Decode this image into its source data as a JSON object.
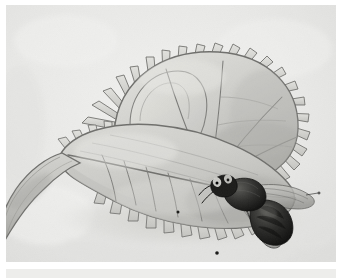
{
  "image": {
    "title": "Venus Flytrap With Captured Fly",
    "medium": "Pencil and wash botanical illustration",
    "palette": "grayscale",
    "subject_label": "Venus flytrap trap lobe",
    "secondary_subject_label": "House fly on trap margin"
  },
  "canvas": {
    "width": 342,
    "height": 278,
    "page_background": "#ffffff",
    "frame_left": 6,
    "frame_top": 5,
    "frame_width": 330,
    "frame_height": 257
  },
  "colors": {
    "paper_background": "#e9e9e7",
    "paper_background_light": "#efefed",
    "paper_background_dark": "#dededc",
    "leaf_fill_light": "#dcdcd8",
    "leaf_fill_mid": "#c9c9c5",
    "leaf_fill_dark": "#b3b3af",
    "leaf_outline": "#6f6f6c",
    "vein_line": "#7b7b78",
    "tooth_fill": "#d6d6d2",
    "tooth_outline": "#6b6b68",
    "stem_fill": "#c4c4c0",
    "stem_shadow": "#9d9d99",
    "fly_body": "#2e2e2c",
    "fly_body_dark": "#141413",
    "fly_wing": "#bdbdb9",
    "fly_leg": "#1c1c1a",
    "ground_shadow": "#d2d2ce",
    "caption_band": "#ededeb"
  },
  "parts": {
    "upper_lobe_label": "Upper trap lobe",
    "lower_lobe_label": "Lower trap lobe",
    "cilia_label": "Marginal cilia (teeth)",
    "midrib_label": "Midrib hinge",
    "petiole_label": "Petiole / leaf stalk",
    "fly_head_label": "Fly head and compound eyes",
    "fly_thorax_label": "Fly thorax",
    "fly_abdomen_label": "Fly abdomen",
    "fly_wings_label": "Fly wings",
    "fly_legs_label": "Fly legs",
    "fly_antenna_label": "Fly antenna"
  },
  "caption": {
    "text": ""
  }
}
